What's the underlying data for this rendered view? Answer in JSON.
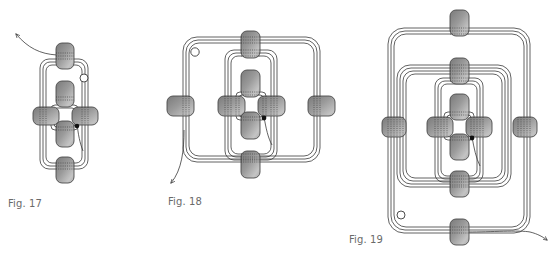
{
  "figures": [
    {
      "id": "fig17",
      "caption": "Fig. 17",
      "description": "Four-bead cross with an elongated thread loop through top and bottom beads",
      "bead_count": 6,
      "loops": 1
    },
    {
      "id": "fig18",
      "caption": "Fig. 18",
      "description": "Cross pattern expanded with a second, square thread loop through left and right outer beads",
      "bead_count": 8,
      "loops": 2
    },
    {
      "id": "fig19",
      "caption": "Fig. 19",
      "description": "Pattern expanded with a third, tall thread loop through a new top and bottom bead",
      "bead_count": 10,
      "loops": 3
    }
  ],
  "colors": {
    "bead_fill": "#8e8e8e",
    "bead_highlight": "#b8b8b8",
    "bead_stroke": "#4a4a4a",
    "thread": "#3a3a3a",
    "caption": "#6a6a6a",
    "background": "#ffffff"
  },
  "markers": {
    "start_marker": "open-circle",
    "end_marker": "filled-dot",
    "thread_exit": "arrow"
  }
}
